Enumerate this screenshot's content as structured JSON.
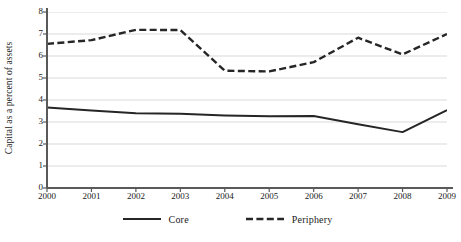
{
  "chart_data": {
    "type": "line",
    "title": "",
    "xlabel": "",
    "ylabel": "Capital as a percent of assets",
    "x": [
      2000,
      2001,
      2002,
      2003,
      2004,
      2005,
      2006,
      2007,
      2008,
      2009
    ],
    "xticklabels": [
      "2000",
      "2001",
      "2002",
      "2003",
      "2004",
      "2005",
      "2006",
      "2007",
      "2008",
      "2009"
    ],
    "yticklabels": [
      "0",
      "1",
      "2",
      "3",
      "4",
      "5",
      "6",
      "7",
      "8"
    ],
    "yticks": [
      0,
      1,
      2,
      3,
      4,
      5,
      6,
      7,
      8
    ],
    "ylim": [
      0,
      8
    ],
    "xlim": [
      2000,
      2009
    ],
    "grid": "horizontal",
    "legend_position": "bottom-center",
    "series": [
      {
        "name": "Core",
        "style": "solid",
        "color": "#262626",
        "values": [
          3.66,
          3.52,
          3.4,
          3.37,
          3.3,
          3.26,
          3.27,
          2.9,
          2.54,
          3.54
        ]
      },
      {
        "name": "Periphery",
        "style": "dashed",
        "color": "#262626",
        "values": [
          6.55,
          6.72,
          7.19,
          7.18,
          5.33,
          5.3,
          5.72,
          6.83,
          6.07,
          7.0
        ]
      }
    ]
  },
  "legend": {
    "items": [
      {
        "label": "Core",
        "style": "solid"
      },
      {
        "label": "Periphery",
        "style": "dashed"
      }
    ]
  },
  "axes": {
    "axis_color": "#595959",
    "grid_color": "#d9d9d9"
  },
  "caption": ""
}
